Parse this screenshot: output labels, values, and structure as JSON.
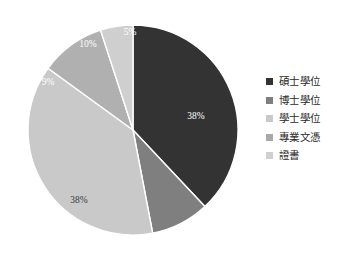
{
  "chart_data": {
    "type": "pie",
    "title": "",
    "subtitle": "",
    "xlabel": "",
    "ylabel": "",
    "grid": false,
    "legend_position": "right",
    "background_color": "#ffffff",
    "center": {
      "x": 133,
      "y": 130
    },
    "radius": 105,
    "start_angle_deg": -90,
    "direction": "clockwise",
    "categories": [
      "碩士學位",
      "博士學位",
      "學士學位",
      "專業文憑",
      "證書"
    ],
    "values": [
      38,
      9,
      38,
      10,
      5
    ],
    "labels": [
      "38%",
      "9%",
      "38%",
      "10%",
      "5%"
    ],
    "colors": [
      "#333333",
      "#7f7f7f",
      "#c9c9c9",
      "#b0b0b0",
      "#cfcfcf"
    ],
    "slices": [
      {
        "name": "碩士學位",
        "value": 38,
        "label": "38%",
        "color": "#333333",
        "label_color": "#ffffff",
        "label_x": 196,
        "label_y": 119
      },
      {
        "name": "學士學位",
        "value": 38,
        "label": "38%",
        "color": "#c9c9c9",
        "label_color": "#3a3a3a",
        "label_x": 79,
        "label_y": 203
      },
      {
        "name": "博士學位",
        "value": 9,
        "label": "9%",
        "color": "#7f7f7f",
        "label_color": "#ffffff",
        "label_x": 48,
        "label_y": 85
      },
      {
        "name": "專業文憑",
        "value": 10,
        "label": "10%",
        "color": "#b0b0b0",
        "label_color": "#ffffff",
        "label_x": 88,
        "label_y": 47
      },
      {
        "name": "證書",
        "value": 5,
        "label": "5%",
        "color": "#cfcfcf",
        "label_color": "#ffffff",
        "label_x": 130,
        "label_y": 35
      }
    ]
  },
  "legend": {
    "items": [
      {
        "label": "碩士學位",
        "color": "#333333"
      },
      {
        "label": "博士學位",
        "color": "#7f7f7f"
      },
      {
        "label": "學士學位",
        "color": "#c9c9c9"
      },
      {
        "label": "專業文憑",
        "color": "#a8a8a8"
      },
      {
        "label": "證書",
        "color": "#cfcfcf"
      }
    ]
  }
}
